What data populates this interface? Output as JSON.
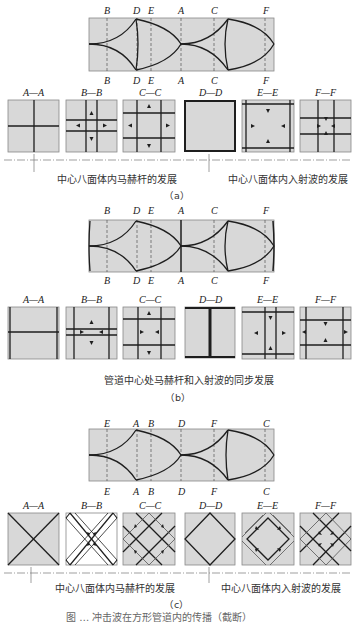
{
  "figure": {
    "colors": {
      "fill": "#d8d8d8",
      "line": "#1e1e1e",
      "dash": "#555555",
      "white": "#ffffff"
    },
    "panels": [
      {
        "id": "a",
        "sublabel": "（a）",
        "station_labels_top": [
          "B",
          "D",
          "E",
          "A",
          "C",
          "F"
        ],
        "station_labels_bottom": [
          "B",
          "D",
          "E",
          "A",
          "C",
          "F"
        ],
        "sections": [
          "A—A",
          "B—B",
          "C—C",
          "D—D",
          "E—E",
          "F—F"
        ],
        "captions": [
          "中心八面体内马赫杆的发展",
          "中心八面体内入射波的发展"
        ]
      },
      {
        "id": "b",
        "sublabel": "（b）",
        "station_labels_top": [
          "B",
          "D",
          "E",
          "A",
          "C",
          "F"
        ],
        "station_labels_bottom": [
          "B",
          "D",
          "E",
          "A",
          "C",
          "F"
        ],
        "sections": [
          "A—A",
          "B—B",
          "C—C",
          "D—D",
          "E—E",
          "F—F"
        ],
        "captions": [
          "管道中心处马赫杆和入射波的同步发展"
        ]
      },
      {
        "id": "c",
        "sublabel": "（c）",
        "station_labels_top": [
          "E",
          "A",
          "B",
          "D",
          "F",
          "C"
        ],
        "station_labels_bottom": [
          "E",
          "A",
          "B",
          "D",
          "F",
          "C"
        ],
        "sections": [
          "A—A",
          "B—B",
          "C—C",
          "D—D",
          "E—E",
          "F—F"
        ],
        "captions": [
          "中心八面体内马赫杆的发展",
          "中心八面体内入射波的发展"
        ]
      }
    ],
    "figure_caption_partial": "图 … 冲击波在方形管道内的传播（截断）"
  }
}
